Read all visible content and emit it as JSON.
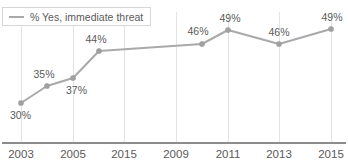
{
  "chart_data": {
    "type": "line",
    "title": "",
    "xlabel": "",
    "ylabel": "",
    "grid": "vertical",
    "legend_position": "top-left",
    "series_color": "#a9a9a9",
    "text_color": "#5a5a5a",
    "gridline_color": "#e3e3e3",
    "axis_color": "#8c8c8c",
    "legend": [
      {
        "name": "% Yes, immediate threat"
      }
    ],
    "x_tick_labels": [
      "2003",
      "2005",
      "2015",
      "2009",
      "2011",
      "2013",
      "2015"
    ],
    "x_tick_positions": [
      21,
      73,
      124,
      176,
      228,
      279,
      331
    ],
    "categories": [
      "2003",
      "2004",
      "2005",
      "2006",
      "2008",
      "2011",
      "2013",
      "2015"
    ],
    "values": [
      30,
      35,
      37,
      44,
      46,
      49,
      46,
      49
    ],
    "point_labels": [
      "30%",
      "35%",
      "37%",
      "44%",
      "46%",
      "49%",
      "46%",
      "49%"
    ],
    "points": [
      {
        "label": "30%",
        "value": 30,
        "x": 21,
        "y": 103,
        "lx": 10,
        "ly": 119,
        "anchor": "start"
      },
      {
        "label": "35%",
        "value": 35,
        "x": 47,
        "y": 86,
        "lx": 44,
        "ly": 78,
        "anchor": "middle"
      },
      {
        "label": "37%",
        "value": 37,
        "x": 73,
        "y": 78,
        "lx": 66,
        "ly": 94,
        "anchor": "start"
      },
      {
        "label": "44%",
        "value": 44,
        "x": 99,
        "y": 51,
        "lx": 96,
        "ly": 43,
        "anchor": "middle"
      },
      {
        "label": "46%",
        "value": 46,
        "x": 202,
        "y": 44,
        "lx": 198,
        "ly": 35,
        "anchor": "middle"
      },
      {
        "label": "49%",
        "value": 49,
        "x": 228,
        "y": 30,
        "lx": 230,
        "ly": 22,
        "anchor": "middle"
      },
      {
        "label": "46%",
        "value": 46,
        "x": 279,
        "y": 44,
        "lx": 279,
        "ly": 36,
        "anchor": "middle"
      },
      {
        "label": "49%",
        "value": 49,
        "x": 331,
        "y": 29,
        "lx": 332,
        "ly": 21,
        "anchor": "middle"
      }
    ],
    "ylim": [
      22,
      56
    ],
    "axis_y": 143,
    "grid_top": 12
  }
}
